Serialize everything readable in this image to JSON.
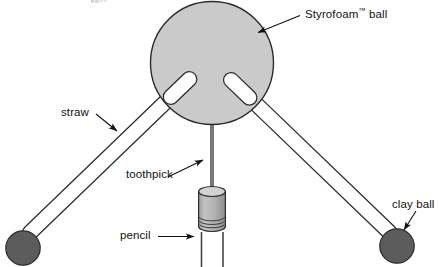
{
  "diagram": {
    "background_color": "#ffffff",
    "labels": {
      "styrofoam_ball": "Styrofoam",
      "styrofoam_ball_tm": "™",
      "styrofoam_ball_suffix": " ball",
      "straw": "straw",
      "toothpick": "toothpick",
      "pencil": "pencil",
      "clay_ball": "clay ball"
    },
    "colors": {
      "ball_fill": "#c9c9c9",
      "ball_stroke": "#2b2b2b",
      "clay_fill": "#5a5a5a",
      "clay_stroke": "#2b2b2b",
      "straw_fill": "#ffffff",
      "straw_stroke": "#2b2b2b",
      "toothpick_fill": "#7d7d7d",
      "eraser_fill": "#b0b0b0",
      "eraser_stroke": "#2b2b2b",
      "pencil_stroke": "#3a3a3a",
      "text": "#111111",
      "leader_line": "#111111"
    },
    "parts": [
      {
        "name": "styrofoam-ball",
        "shape": "circle",
        "cx": 212,
        "cy": 63,
        "r": 62
      },
      {
        "name": "left-straw",
        "shape": "tube",
        "x1": 191,
        "y1": 91,
        "x2": 33,
        "y2": 243
      },
      {
        "name": "right-straw",
        "shape": "tube",
        "x1": 240,
        "y1": 92,
        "x2": 390,
        "y2": 239
      },
      {
        "name": "left-clay-ball",
        "shape": "circle",
        "cx": 23,
        "cy": 248,
        "r": 17
      },
      {
        "name": "right-clay-ball",
        "shape": "circle",
        "cx": 397,
        "cy": 246,
        "r": 17
      },
      {
        "name": "toothpick",
        "shape": "rod",
        "x1": 212,
        "y1": 122,
        "x2": 212,
        "y2": 190
      },
      {
        "name": "pencil-eraser",
        "shape": "cylinder",
        "cx": 212,
        "cy": 205,
        "width": 28,
        "height": 40
      },
      {
        "name": "pencil-body",
        "shape": "lines",
        "cx": 212,
        "top": 236,
        "bottom": 267,
        "width": 22
      }
    ],
    "leaders": [
      {
        "name": "styrofoam-ball-leader",
        "from": [
          300,
          17
        ],
        "to": [
          255,
          33
        ],
        "arrow": true
      },
      {
        "name": "straw-leader",
        "from": [
          95,
          116
        ],
        "to": [
          119,
          133
        ],
        "arrow": true
      },
      {
        "name": "toothpick-leader",
        "from": [
          170,
          178
        ],
        "to": [
          205,
          161
        ],
        "arrow": true
      },
      {
        "name": "pencil-leader",
        "from": [
          159,
          237
        ],
        "to": [
          196,
          237
        ],
        "arrow": true
      },
      {
        "name": "clay-ball-leader",
        "from": [
          414,
          212
        ],
        "to": [
          403,
          231
        ],
        "arrow": true
      }
    ]
  }
}
